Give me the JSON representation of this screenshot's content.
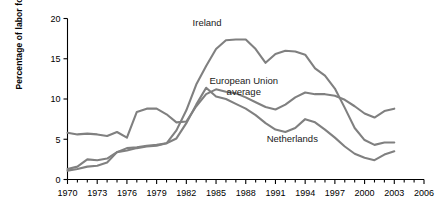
{
  "chart_data": {
    "type": "line",
    "title": "",
    "xlabel": "",
    "ylabel": "Percentage of labor force",
    "xlim": [
      1970,
      2006
    ],
    "ylim": [
      0,
      20
    ],
    "yticks": [
      0,
      5,
      10,
      15,
      20
    ],
    "xticks": [
      1970,
      1973,
      1976,
      1979,
      1982,
      1985,
      1988,
      1991,
      1994,
      1997,
      2000,
      2003,
      2006
    ],
    "x_minor_tick_step": 1,
    "grid": false,
    "legend_position": "inline-annotations",
    "line_color": "#808080",
    "axis_color": "#000000",
    "x": [
      1970,
      1971,
      1972,
      1973,
      1974,
      1975,
      1976,
      1977,
      1978,
      1979,
      1980,
      1981,
      1982,
      1983,
      1984,
      1985,
      1986,
      1987,
      1988,
      1989,
      1990,
      1991,
      1992,
      1993,
      1994,
      1995,
      1996,
      1997,
      1998,
      1999,
      2000,
      2001,
      2002,
      2003
    ],
    "series": [
      {
        "name": "Ireland",
        "label": "Ireland",
        "label_x": 1984.1,
        "label_y": 19.1,
        "values": [
          1.3,
          1.6,
          2.5,
          2.4,
          2.6,
          3.4,
          3.9,
          4.0,
          4.2,
          4.3,
          4.5,
          6.1,
          8.6,
          11.8,
          14.1,
          16.2,
          17.3,
          17.4,
          17.4,
          16.2,
          14.5,
          15.6,
          16.0,
          15.9,
          15.5,
          13.8,
          12.9,
          11.3,
          8.9,
          6.4,
          4.9,
          4.3,
          4.6,
          4.6
        ]
      },
      {
        "name": "European Union average",
        "label": "European Union\naverage",
        "label_x": 1987.8,
        "label_y": 11.9,
        "values": [
          5.8,
          5.6,
          5.7,
          5.6,
          5.4,
          5.9,
          5.2,
          8.4,
          8.8,
          8.8,
          8.1,
          7.1,
          7.2,
          9.1,
          10.6,
          11.2,
          10.9,
          10.7,
          10.2,
          9.6,
          9.0,
          8.7,
          9.3,
          10.2,
          10.8,
          10.6,
          10.6,
          10.4,
          9.9,
          9.1,
          8.2,
          7.7,
          8.5,
          8.8
        ]
      },
      {
        "name": "Netherlands",
        "label": "Netherlands",
        "label_x": 1992.7,
        "label_y": 4.6,
        "values": [
          1.1,
          1.3,
          1.6,
          1.7,
          2.1,
          3.4,
          3.6,
          3.9,
          4.1,
          4.2,
          4.5,
          5.1,
          7.0,
          9.3,
          11.4,
          10.3,
          10.0,
          9.4,
          8.8,
          8.0,
          7.0,
          6.2,
          5.9,
          6.4,
          7.5,
          7.1,
          6.2,
          5.2,
          4.1,
          3.2,
          2.7,
          2.4,
          3.1,
          3.5
        ]
      }
    ]
  },
  "axes": {
    "y_tick_labels": [
      "0",
      "5",
      "10",
      "15",
      "20"
    ],
    "x_tick_labels": [
      "1970",
      "1973",
      "1976",
      "1979",
      "1982",
      "1985",
      "1988",
      "1991",
      "1994",
      "1997",
      "2000",
      "2003",
      "2006"
    ]
  }
}
